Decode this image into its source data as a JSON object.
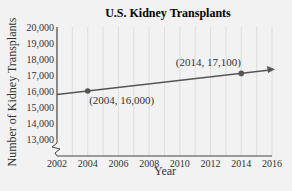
{
  "chart_data": {
    "type": "line",
    "title": "U.S. Kidney Transplants",
    "xlabel": "Year",
    "ylabel": "Number of Kidney Transplants",
    "xlim": [
      2002,
      2016
    ],
    "ylim": [
      13000,
      20000
    ],
    "x_ticks": [
      "2002",
      "2004",
      "2006",
      "2008",
      "2010",
      "2012",
      "2014",
      "2016"
    ],
    "y_ticks": [
      "13,000",
      "14,000",
      "15,000",
      "16,000",
      "17,000",
      "18,000",
      "19,000",
      "20,000"
    ],
    "grid": true,
    "axis_break": true,
    "series": [
      {
        "name": "Kidney transplants trend",
        "x": [
          2002,
          2016
        ],
        "y": [
          15780,
          17320
        ],
        "style": "line with arrow"
      }
    ],
    "points": [
      {
        "x": 2004,
        "y": 16000,
        "label": "(2004, 16,000)"
      },
      {
        "x": 2014,
        "y": 17100,
        "label": "(2014, 17,100)"
      }
    ]
  },
  "colors": {
    "background": "#f2f2f2",
    "grid": "#d8d8d8",
    "line": "#555555",
    "axis": "#444444"
  }
}
